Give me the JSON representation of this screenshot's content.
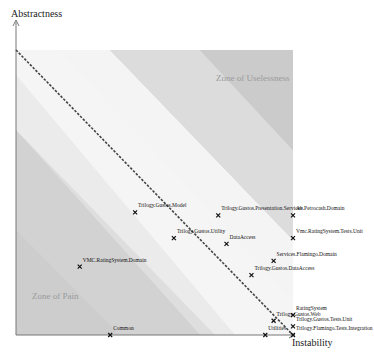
{
  "chart_data": {
    "type": "scatter",
    "title": "",
    "xlabel": "Instability",
    "ylabel": "Abstractness",
    "xlim": [
      0,
      1
    ],
    "ylim": [
      0,
      1
    ],
    "grid": false,
    "legend": "none",
    "main_sequence": {
      "from": [
        0,
        1
      ],
      "to": [
        1,
        0
      ],
      "style": "dashed"
    },
    "annotations": [
      {
        "text": "Zone of Uselessness",
        "x": 0.88,
        "y": 0.88
      },
      {
        "text": "Zone of Pain",
        "x": 0.12,
        "y": 0.12
      }
    ],
    "points": [
      {
        "label": "Trilogy.Gustos.Model",
        "x": 0.43,
        "y": 0.43
      },
      {
        "label": "Trilogy.Gustos.Presentation.Services",
        "x": 0.73,
        "y": 0.42
      },
      {
        "label": "Ab.Petrocash.Domain",
        "x": 1.0,
        "y": 0.42
      },
      {
        "label": "Trilogy.Gustos.Utility",
        "x": 0.57,
        "y": 0.34
      },
      {
        "label": "DataAccess",
        "x": 0.76,
        "y": 0.32
      },
      {
        "label": "Vmc.RatingSystem.Tests.Unit",
        "x": 1.0,
        "y": 0.34
      },
      {
        "label": "Services.Flamingo.Domain",
        "x": 0.93,
        "y": 0.26
      },
      {
        "label": "Trilogy.Gustos.DataAccess",
        "x": 0.85,
        "y": 0.21
      },
      {
        "label": "VMC.RatingSystem.Domain",
        "x": 0.23,
        "y": 0.24
      },
      {
        "label": "RatingSystem",
        "x": 1.0,
        "y": 0.07
      },
      {
        "label": "Trilogy.Gustos.Web",
        "x": 0.93,
        "y": 0.05
      },
      {
        "label": "Trilogy.Gustos.Tests.Unit",
        "x": 1.0,
        "y": 0.03
      },
      {
        "label": "Trilogy.Flamingo.Tests.Integration",
        "x": 1.0,
        "y": 0.0
      },
      {
        "label": "Utilities",
        "x": 0.9,
        "y": 0.0
      },
      {
        "label": "Common",
        "x": 0.34,
        "y": 0.0
      }
    ]
  },
  "axes": {
    "x_title": "Instability",
    "y_title": "Abstractness"
  },
  "zones": {
    "useless": "Zone of Uselessness",
    "pain": "Zone of Pain"
  }
}
